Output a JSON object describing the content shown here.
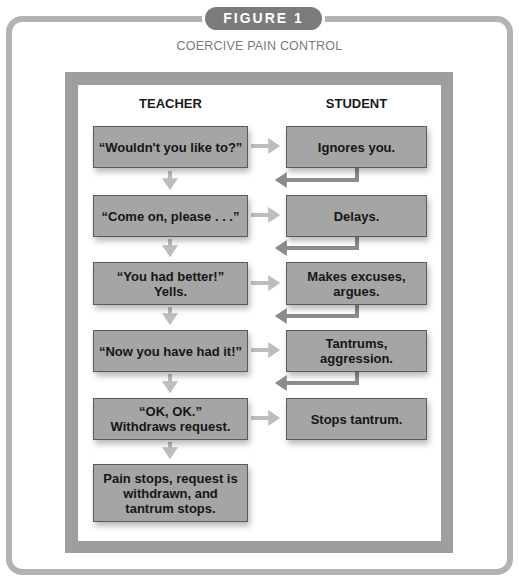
{
  "figure": {
    "badge": "FIGURE 1",
    "title": "COERCIVE PAIN CONTROL"
  },
  "columns": {
    "teacher": "TEACHER",
    "student": "STUDENT"
  },
  "teacher_steps": [
    "“Wouldn't you like to?”",
    "“Come on, please . . .”",
    "“You had better!”\nYells.",
    "“Now you have had it!”",
    "“OK, OK.”\nWithdraws request.",
    "Pain stops, request is\nwithdrawn, and\ntantrum stops."
  ],
  "student_responses": [
    "Ignores you.",
    "Delays.",
    "Makes excuses,\nargues.",
    "Tantrums,\naggression.",
    "Stops tantrum."
  ],
  "colors": {
    "frame_outer": "#b3b3b3",
    "frame_inner": "#9e9e9e",
    "badge": "#7b7b7b",
    "box_fill": "#a5a5a5",
    "forward_arrow": "#bdbdbd",
    "return_arrow": "#8c8c8c"
  }
}
